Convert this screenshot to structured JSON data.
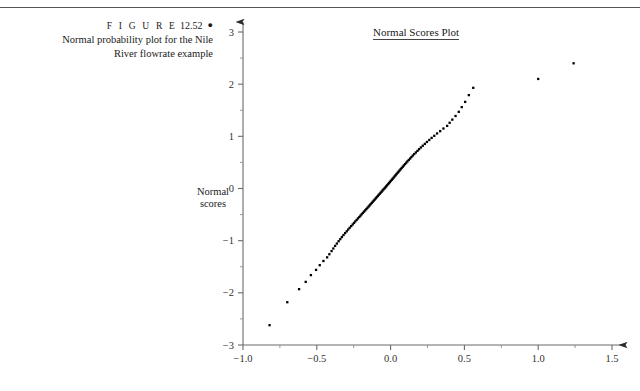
{
  "figure": {
    "label": "F I G U R E",
    "number": "12.52",
    "bullet": "●",
    "caption_line1": "Normal probability plot for the Nile",
    "caption_line2": "River flowrate example"
  },
  "axis_label": {
    "y_line1": "Normal",
    "y_line2": "scores"
  },
  "chart_data": {
    "type": "scatter",
    "title": "Normal Scores Plot",
    "xlabel": "",
    "ylabel": "Normal scores",
    "xlim": [
      -1.0,
      1.5
    ],
    "ylim": [
      -3.0,
      3.0
    ],
    "grid": false,
    "legend": null,
    "xticks": [
      -1.0,
      -0.5,
      0.0,
      0.5,
      1.0,
      1.5
    ],
    "xticklabels": [
      "−1.0",
      "−0.5",
      "0.0",
      "0.5",
      "1.0",
      "1.5"
    ],
    "xticks_minor": [
      -0.75,
      -0.25,
      0.25,
      0.75,
      1.25
    ],
    "yticks": [
      -3,
      -2,
      -1,
      0,
      1,
      2,
      3
    ],
    "yticklabels": [
      "−3",
      "−2",
      "−1",
      "0",
      "1",
      "2",
      "3"
    ],
    "yticks_minor": [
      -2.5,
      -1.5,
      -0.5,
      0.5,
      1.5,
      2.5
    ],
    "marker": "square-dot",
    "marker_color": "#000000",
    "points": [
      [
        -0.82,
        -2.62
      ],
      [
        -0.7,
        -2.18
      ],
      [
        -0.62,
        -1.93
      ],
      [
        -0.575,
        -1.79
      ],
      [
        -0.54,
        -1.66
      ],
      [
        -0.505,
        -1.56
      ],
      [
        -0.48,
        -1.47
      ],
      [
        -0.455,
        -1.39
      ],
      [
        -0.43,
        -1.32
      ],
      [
        -0.415,
        -1.26
      ],
      [
        -0.4,
        -1.2
      ],
      [
        -0.388,
        -1.15
      ],
      [
        -0.376,
        -1.1
      ],
      [
        -0.364,
        -1.055
      ],
      [
        -0.352,
        -1.01
      ],
      [
        -0.341,
        -0.97
      ],
      [
        -0.33,
        -0.93
      ],
      [
        -0.319,
        -0.892
      ],
      [
        -0.308,
        -0.855
      ],
      [
        -0.297,
        -0.82
      ],
      [
        -0.287,
        -0.786
      ],
      [
        -0.277,
        -0.753
      ],
      [
        -0.267,
        -0.721
      ],
      [
        -0.257,
        -0.69
      ],
      [
        -0.248,
        -0.66
      ],
      [
        -0.239,
        -0.631
      ],
      [
        -0.23,
        -0.602
      ],
      [
        -0.221,
        -0.574
      ],
      [
        -0.212,
        -0.547
      ],
      [
        -0.204,
        -0.52
      ],
      [
        -0.196,
        -0.494
      ],
      [
        -0.188,
        -0.468
      ],
      [
        -0.18,
        -0.443
      ],
      [
        -0.172,
        -0.418
      ],
      [
        -0.164,
        -0.394
      ],
      [
        -0.157,
        -0.37
      ],
      [
        -0.149,
        -0.346
      ],
      [
        -0.142,
        -0.323
      ],
      [
        -0.135,
        -0.3
      ],
      [
        -0.128,
        -0.277
      ],
      [
        -0.121,
        -0.254
      ],
      [
        -0.114,
        -0.232
      ],
      [
        -0.107,
        -0.21
      ],
      [
        -0.1,
        -0.188
      ],
      [
        -0.094,
        -0.166
      ],
      [
        -0.087,
        -0.145
      ],
      [
        -0.081,
        -0.124
      ],
      [
        -0.074,
        -0.103
      ],
      [
        -0.068,
        -0.082
      ],
      [
        -0.061,
        -0.061
      ],
      [
        -0.055,
        -0.04
      ],
      [
        -0.049,
        -0.02
      ],
      [
        -0.042,
        0.0
      ],
      [
        -0.036,
        0.02
      ],
      [
        -0.03,
        0.04
      ],
      [
        -0.024,
        0.061
      ],
      [
        -0.017,
        0.082
      ],
      [
        -0.011,
        0.103
      ],
      [
        -0.005,
        0.124
      ],
      [
        0.001,
        0.145
      ],
      [
        0.008,
        0.166
      ],
      [
        0.014,
        0.188
      ],
      [
        0.021,
        0.21
      ],
      [
        0.027,
        0.232
      ],
      [
        0.034,
        0.254
      ],
      [
        0.04,
        0.277
      ],
      [
        0.047,
        0.3
      ],
      [
        0.054,
        0.323
      ],
      [
        0.061,
        0.346
      ],
      [
        0.068,
        0.37
      ],
      [
        0.075,
        0.394
      ],
      [
        0.083,
        0.418
      ],
      [
        0.09,
        0.443
      ],
      [
        0.098,
        0.468
      ],
      [
        0.106,
        0.494
      ],
      [
        0.114,
        0.52
      ],
      [
        0.123,
        0.547
      ],
      [
        0.132,
        0.574
      ],
      [
        0.141,
        0.602
      ],
      [
        0.15,
        0.631
      ],
      [
        0.16,
        0.66
      ],
      [
        0.171,
        0.69
      ],
      [
        0.182,
        0.721
      ],
      [
        0.193,
        0.753
      ],
      [
        0.205,
        0.786
      ],
      [
        0.218,
        0.82
      ],
      [
        0.232,
        0.855
      ],
      [
        0.246,
        0.892
      ],
      [
        0.262,
        0.93
      ],
      [
        0.278,
        0.97
      ],
      [
        0.296,
        1.01
      ],
      [
        0.315,
        1.055
      ],
      [
        0.336,
        1.1
      ],
      [
        0.358,
        1.15
      ],
      [
        0.383,
        1.2
      ],
      [
        0.4,
        1.26
      ],
      [
        0.418,
        1.32
      ],
      [
        0.44,
        1.39
      ],
      [
        0.462,
        1.47
      ],
      [
        0.482,
        1.56
      ],
      [
        0.505,
        1.66
      ],
      [
        0.53,
        1.79
      ],
      [
        0.56,
        1.93
      ],
      [
        1.0,
        2.1
      ],
      [
        1.24,
        2.4
      ]
    ]
  }
}
